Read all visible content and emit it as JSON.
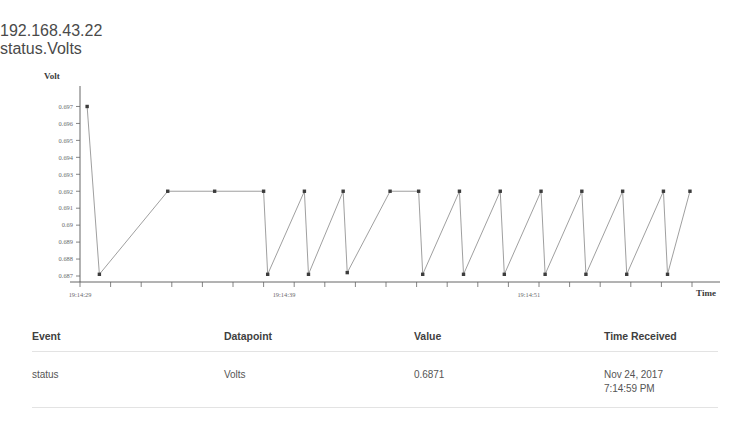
{
  "header": {
    "device_ip": "192.168.43.22",
    "metric_label": "status.Volts"
  },
  "chart_data": {
    "type": "line",
    "title": "",
    "xlabel": "Time",
    "ylabel": "Volt",
    "grid": false,
    "legend": "none",
    "ylim": [
      0.687,
      0.6975
    ],
    "ytick_labels": [
      "0.697",
      "0.696",
      "0.695",
      "0.694",
      "0.693",
      "0.692",
      "0.691",
      "0.69",
      "0.689",
      "0.688",
      "0.687"
    ],
    "ytick_values": [
      0.697,
      0.696,
      0.695,
      0.694,
      0.693,
      0.692,
      0.691,
      0.69,
      0.689,
      0.688,
      0.687
    ],
    "xtick_labels": [
      "19:14:29",
      "19:14:39",
      "19:14:51"
    ],
    "xtick_label_positions": [
      0,
      10,
      22
    ],
    "xlim": [
      0,
      30
    ],
    "series": [
      {
        "name": "status.Volts",
        "x": [
          0.35,
          0.95,
          4.3,
          6.6,
          9.0,
          9.2,
          11.0,
          11.2,
          12.9,
          13.1,
          15.2,
          16.6,
          16.8,
          18.6,
          18.8,
          20.6,
          20.8,
          22.6,
          22.8,
          24.6,
          24.8,
          26.6,
          26.8,
          28.6,
          28.8,
          29.9
        ],
        "y": [
          0.697,
          0.6871,
          0.692,
          0.692,
          0.692,
          0.6871,
          0.692,
          0.6871,
          0.692,
          0.6872,
          0.692,
          0.692,
          0.6871,
          0.692,
          0.6871,
          0.692,
          0.6871,
          0.692,
          0.6871,
          0.692,
          0.6871,
          0.692,
          0.6871,
          0.692,
          0.6871,
          0.692
        ]
      }
    ]
  },
  "table": {
    "columns": [
      "Event",
      "Datapoint",
      "Value",
      "Time Received"
    ],
    "rows": [
      {
        "event": "status",
        "datapoint": "Volts",
        "value": "0.6871",
        "time_date": "Nov 24, 2017",
        "time_clock": "7:14:59 PM"
      }
    ]
  }
}
